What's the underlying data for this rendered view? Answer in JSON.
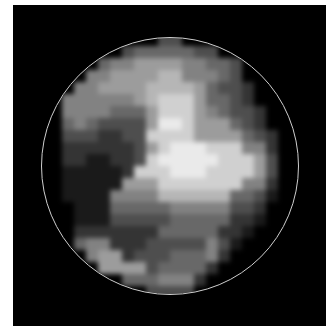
{
  "image": {
    "description": "Pixelated grayscale disc image inside a thin circular outline on a black square panel",
    "background_color": "#000000",
    "border_color": "#ffffff",
    "ring": {
      "center_x": 170,
      "center_y": 166,
      "radius": 129,
      "color": "#cfcfcf"
    },
    "grid": {
      "origin_x": 38,
      "origin_y": 34,
      "cell_size": 12,
      "cols": 22,
      "rows": 22,
      "levels_0_to_9": [
        [
          0,
          0,
          0,
          0,
          0,
          0,
          0,
          0,
          0,
          0,
          3,
          3,
          0,
          0,
          0,
          0,
          0,
          0,
          0,
          0,
          0,
          0
        ],
        [
          0,
          0,
          0,
          0,
          0,
          0,
          0,
          3,
          4,
          4,
          4,
          4,
          4,
          3,
          3,
          0,
          0,
          0,
          0,
          0,
          0,
          0
        ],
        [
          0,
          0,
          0,
          0,
          0,
          4,
          5,
          5,
          6,
          6,
          6,
          6,
          5,
          5,
          4,
          4,
          3,
          0,
          0,
          0,
          0,
          0
        ],
        [
          0,
          0,
          0,
          0,
          5,
          5,
          6,
          6,
          6,
          6,
          7,
          7,
          5,
          5,
          5,
          4,
          3,
          0,
          0,
          0,
          0,
          0
        ],
        [
          0,
          0,
          0,
          5,
          5,
          6,
          6,
          6,
          6,
          7,
          7,
          7,
          7,
          6,
          4,
          3,
          3,
          2,
          0,
          0,
          0,
          0
        ],
        [
          0,
          0,
          5,
          5,
          5,
          5,
          5,
          5,
          6,
          7,
          8,
          8,
          8,
          6,
          4,
          4,
          3,
          2,
          0,
          0,
          0,
          0
        ],
        [
          0,
          0,
          5,
          5,
          5,
          5,
          4,
          4,
          4,
          6,
          8,
          8,
          8,
          6,
          5,
          4,
          3,
          3,
          2,
          0,
          0,
          0
        ],
        [
          0,
          0,
          4,
          5,
          4,
          3,
          3,
          3,
          3,
          6,
          9,
          9,
          8,
          6,
          6,
          6,
          4,
          3,
          2,
          0,
          0,
          0
        ],
        [
          0,
          0,
          3,
          3,
          3,
          2,
          2,
          3,
          3,
          8,
          8,
          8,
          8,
          6,
          6,
          6,
          6,
          4,
          3,
          2,
          0,
          0
        ],
        [
          0,
          0,
          2,
          2,
          2,
          2,
          2,
          2,
          3,
          6,
          8,
          9,
          9,
          9,
          8,
          8,
          8,
          5,
          5,
          2,
          0,
          0
        ],
        [
          0,
          0,
          2,
          2,
          1,
          1,
          2,
          2,
          3,
          8,
          9,
          9,
          9,
          9,
          9,
          8,
          8,
          8,
          6,
          3,
          0,
          0
        ],
        [
          0,
          0,
          1,
          1,
          1,
          1,
          1,
          2,
          8,
          8,
          8,
          9,
          9,
          9,
          8,
          8,
          8,
          8,
          6,
          3,
          0,
          0
        ],
        [
          0,
          0,
          1,
          1,
          1,
          1,
          1,
          6,
          6,
          6,
          8,
          8,
          8,
          8,
          8,
          8,
          8,
          5,
          5,
          2,
          0,
          0
        ],
        [
          0,
          0,
          1,
          1,
          1,
          1,
          5,
          5,
          5,
          5,
          7,
          7,
          7,
          7,
          7,
          7,
          4,
          4,
          3,
          1,
          0,
          0
        ],
        [
          0,
          0,
          0,
          1,
          1,
          1,
          4,
          4,
          4,
          4,
          4,
          5,
          5,
          5,
          5,
          5,
          3,
          3,
          2,
          0,
          0,
          0
        ],
        [
          0,
          0,
          0,
          1,
          1,
          1,
          3,
          3,
          3,
          3,
          3,
          4,
          4,
          4,
          4,
          4,
          2,
          2,
          1,
          0,
          0,
          0
        ],
        [
          0,
          0,
          0,
          2,
          2,
          2,
          2,
          2,
          2,
          2,
          4,
          4,
          4,
          4,
          4,
          2,
          2,
          1,
          0,
          0,
          0,
          0
        ],
        [
          0,
          0,
          0,
          4,
          5,
          5,
          2,
          2,
          2,
          3,
          3,
          3,
          3,
          3,
          5,
          3,
          1,
          0,
          0,
          0,
          0,
          0
        ],
        [
          0,
          0,
          0,
          0,
          5,
          6,
          6,
          2,
          3,
          3,
          3,
          4,
          4,
          4,
          5,
          2,
          0,
          0,
          0,
          0,
          0,
          0
        ],
        [
          0,
          0,
          0,
          0,
          0,
          6,
          6,
          6,
          6,
          3,
          4,
          4,
          4,
          4,
          2,
          0,
          0,
          0,
          0,
          0,
          0,
          0
        ],
        [
          0,
          0,
          0,
          0,
          0,
          0,
          0,
          4,
          4,
          4,
          5,
          5,
          5,
          2,
          0,
          0,
          0,
          0,
          0,
          0,
          0,
          0
        ],
        [
          0,
          0,
          0,
          0,
          0,
          0,
          0,
          0,
          0,
          3,
          3,
          3,
          3,
          0,
          0,
          0,
          0,
          0,
          0,
          0,
          0,
          0
        ]
      ]
    }
  }
}
